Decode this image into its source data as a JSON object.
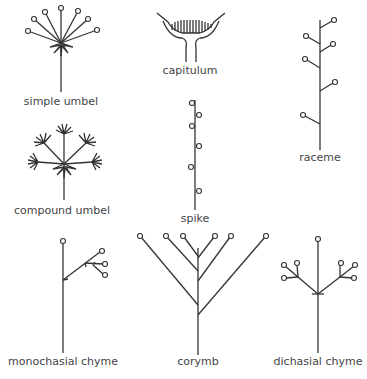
{
  "labels": {
    "simple_umbel": "simple umbel",
    "capitulum": "capitulum",
    "raceme": "raceme",
    "compound_umbel": "compound umbel",
    "spike": "spike",
    "monochasial_chyme": "monochasial chyme",
    "corymb": "corymb",
    "dichasial_chyme": "dichasial chyme"
  },
  "colors": {
    "line": "#333333",
    "text": "#444444",
    "background": "#ffffff"
  }
}
